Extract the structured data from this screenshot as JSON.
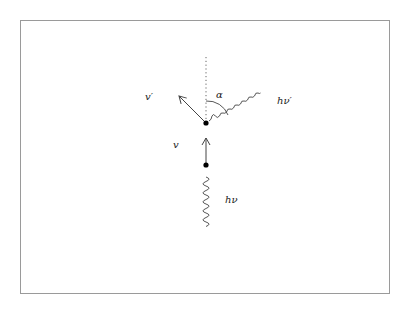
{
  "diagram": {
    "type": "compton-scattering",
    "labels": {
      "scattered_velocity": "v′",
      "angle": "α",
      "scattered_photon": "hν′",
      "incident_velocity": "v",
      "incident_photon": "hν"
    },
    "colors": {
      "stroke": "#444444",
      "frame": "#9a9a9a",
      "dot": "#000000"
    }
  }
}
